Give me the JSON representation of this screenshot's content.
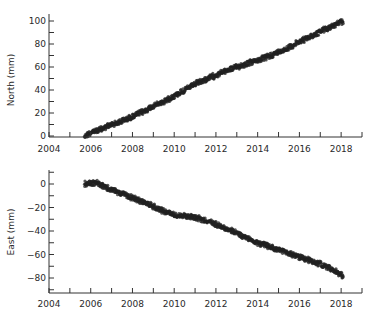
{
  "chart_data": [
    {
      "type": "scatter",
      "title": "",
      "xlabel": "",
      "ylabel": "North (mm)",
      "xlim": [
        2004,
        2019
      ],
      "ylim": [
        -2,
        104
      ],
      "x_ticks": [
        2004,
        2006,
        2008,
        2010,
        2012,
        2014,
        2016,
        2018
      ],
      "x_minor_ticks": [
        2005,
        2007,
        2009,
        2011,
        2013,
        2015,
        2017,
        2019
      ],
      "y_ticks": [
        0,
        20,
        40,
        60,
        80,
        100
      ],
      "y_minor_ticks": [
        10,
        30,
        50,
        70,
        90
      ],
      "grid": false,
      "legend": null,
      "marker_color": "#222222",
      "series": [
        {
          "name": "North",
          "x": [
            2005.7,
            2006.0,
            2006.5,
            2007.0,
            2007.5,
            2008.0,
            2008.5,
            2009.0,
            2009.5,
            2010.0,
            2010.5,
            2011.0,
            2011.5,
            2012.0,
            2012.5,
            2013.0,
            2013.5,
            2014.0,
            2014.5,
            2015.0,
            2015.5,
            2016.0,
            2016.5,
            2017.0,
            2017.5,
            2018.0,
            2018.1
          ],
          "values": [
            0,
            3,
            6,
            10,
            13,
            17,
            21,
            26,
            30,
            35,
            40,
            45,
            49,
            53,
            57,
            60,
            63,
            66,
            69,
            73,
            77,
            82,
            86,
            91,
            95,
            99,
            100
          ]
        }
      ]
    },
    {
      "type": "scatter",
      "title": "",
      "xlabel": "",
      "ylabel": "East (mm)",
      "xlim": [
        2004,
        2019
      ],
      "ylim": [
        -93,
        12
      ],
      "x_ticks": [
        2004,
        2006,
        2008,
        2010,
        2012,
        2014,
        2016,
        2018
      ],
      "x_minor_ticks": [
        2005,
        2007,
        2009,
        2011,
        2013,
        2015,
        2017,
        2019
      ],
      "y_ticks": [
        0,
        -20,
        -40,
        -60,
        -80
      ],
      "y_minor_ticks": [
        10,
        -10,
        -30,
        -50,
        -70,
        -90
      ],
      "grid": false,
      "legend": null,
      "marker_color": "#222222",
      "series": [
        {
          "name": "East",
          "x": [
            2005.7,
            2006.0,
            2006.3,
            2006.6,
            2007.0,
            2007.5,
            2008.0,
            2008.5,
            2009.0,
            2009.5,
            2010.0,
            2010.5,
            2011.0,
            2011.5,
            2012.0,
            2012.5,
            2013.0,
            2013.5,
            2014.0,
            2014.5,
            2015.0,
            2015.5,
            2016.0,
            2016.5,
            2017.0,
            2017.5,
            2018.0,
            2018.1
          ],
          "values": [
            0,
            1,
            1,
            -2,
            -5,
            -8,
            -12,
            -15,
            -19,
            -23,
            -26,
            -27,
            -28,
            -31,
            -34,
            -38,
            -42,
            -46,
            -50,
            -53,
            -56,
            -59,
            -62,
            -65,
            -68,
            -72,
            -77,
            -79
          ]
        }
      ]
    }
  ]
}
